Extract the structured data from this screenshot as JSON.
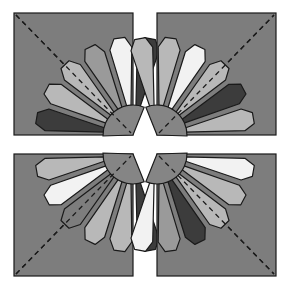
{
  "colors": {
    "background": "#ffffff",
    "square": "#7d7d7d",
    "outline": "#1a1a1a",
    "dark": "#3c3c3c",
    "white": "#f2f2f2",
    "light": "#b8b8b8",
    "medium": "#9a9a9a",
    "hub": "#858585"
  },
  "geometry": {
    "inner_radius": 28,
    "outer_radius": 98,
    "tip_extra": 10,
    "blade_half_angle": 7.2
  },
  "quadrants": [
    {
      "id": "top-left",
      "square": {
        "x": 14,
        "y": 13,
        "w": 119,
        "h": 122
      },
      "center": {
        "x": 133,
        "y": 135
      },
      "diagonal": [
        [
          16,
          15
        ],
        [
          131,
          133
        ]
      ],
      "blades": [
        {
          "angle": -80,
          "shade": "dark"
        },
        {
          "angle": -98,
          "shade": "white"
        },
        {
          "angle": -116,
          "shade": "medium"
        },
        {
          "angle": -134,
          "shade": "light"
        },
        {
          "angle": -152,
          "shade": "light"
        },
        {
          "angle": -170,
          "shade": "dark"
        }
      ]
    },
    {
      "id": "top-right",
      "square": {
        "x": 157,
        "y": 13,
        "w": 119,
        "h": 122
      },
      "center": {
        "x": 157,
        "y": 135
      },
      "diagonal": [
        [
          159,
          133
        ],
        [
          274,
          15
        ]
      ],
      "blades": [
        {
          "angle": -100,
          "shade": "light"
        },
        {
          "angle": -82,
          "shade": "light"
        },
        {
          "angle": -64,
          "shade": "white"
        },
        {
          "angle": -46,
          "shade": "light"
        },
        {
          "angle": -28,
          "shade": "dark"
        },
        {
          "angle": -10,
          "shade": "light"
        }
      ]
    },
    {
      "id": "bottom-left",
      "square": {
        "x": 14,
        "y": 154,
        "w": 119,
        "h": 122
      },
      "center": {
        "x": 133,
        "y": 154
      },
      "diagonal": [
        [
          16,
          274
        ],
        [
          131,
          156
        ]
      ],
      "blades": [
        {
          "angle": 170,
          "shade": "light"
        },
        {
          "angle": 152,
          "shade": "white"
        },
        {
          "angle": 134,
          "shade": "square"
        },
        {
          "angle": 116,
          "shade": "light"
        },
        {
          "angle": 98,
          "shade": "light"
        },
        {
          "angle": 80,
          "shade": "dark"
        }
      ]
    },
    {
      "id": "bottom-right",
      "square": {
        "x": 157,
        "y": 154,
        "w": 119,
        "h": 122
      },
      "center": {
        "x": 157,
        "y": 154
      },
      "diagonal": [
        [
          159,
          156
        ],
        [
          274,
          274
        ]
      ],
      "blades": [
        {
          "angle": 10,
          "shade": "white"
        },
        {
          "angle": 28,
          "shade": "light"
        },
        {
          "angle": 46,
          "shade": "light"
        },
        {
          "angle": 64,
          "shade": "dark"
        },
        {
          "angle": 82,
          "shade": "medium"
        },
        {
          "angle": 100,
          "shade": "white"
        }
      ]
    }
  ]
}
